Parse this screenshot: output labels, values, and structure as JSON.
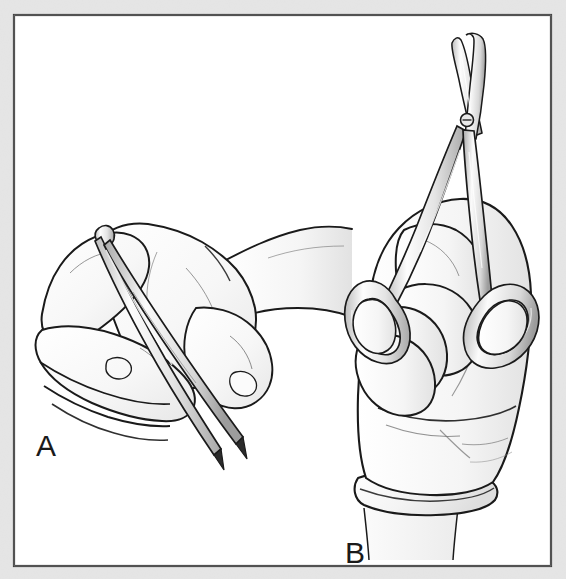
{
  "figure": {
    "kind": "line-art medical illustration",
    "background_color": "#e8e8e8",
    "page_color": "#ffffff",
    "frame_color": "#3a3a3a",
    "ink_color": "#1a1a1a",
    "shade_light": "#f4f4f4",
    "shade_mid": "#e6e6e6",
    "shade_dark": "#d2d2d2",
    "metal_color": "#ededed"
  },
  "panels": [
    {
      "id": "A",
      "label": "A",
      "subject": "hand-holding-forceps",
      "instrument": "tissue-forceps",
      "grip": "pencil-grip",
      "label_x": 36,
      "label_y": 456
    },
    {
      "id": "B",
      "label": "B",
      "subject": "gloved-hand-holding-scissors",
      "instrument": "curved-surgical-scissors",
      "grip": "thumb-and-ring-finger-in-rings",
      "label_x": 345,
      "label_y": 563
    }
  ]
}
